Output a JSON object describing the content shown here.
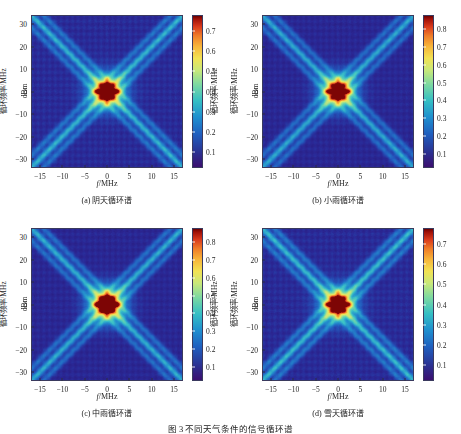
{
  "figure": {
    "caption": "图 3   不同天气条件的信号循环谱",
    "axis": {
      "xlabel": "f/MHz",
      "ylabel": "循环频率/MHz",
      "xticks": [
        -15,
        -10,
        -5,
        0,
        5,
        10,
        15
      ],
      "yticks": [
        30,
        20,
        10,
        0,
        -10,
        -20,
        -30
      ],
      "xlim": [
        -17,
        17
      ],
      "ylim": [
        -34,
        34
      ],
      "colorbar_label": "dBm"
    }
  },
  "chart_data": {
    "type": "heatmap",
    "title": "图 3   不同天气条件的信号循环谱",
    "xlabel": "f/MHz",
    "ylabel": "循环频率/MHz",
    "zlabel": "dBm",
    "xlim": [
      -17,
      17
    ],
    "ylim": [
      -34,
      34
    ],
    "xticks": [
      -15,
      -10,
      -5,
      0,
      5,
      10,
      15
    ],
    "yticks": [
      -30,
      -20,
      -10,
      0,
      10,
      20,
      30
    ],
    "grid": false,
    "legend": "colorbar-right",
    "colormap": "jet",
    "panels": [
      {
        "id": "a",
        "caption": "(a) 阴天循环谱",
        "label": "阴天循环谱",
        "weather": "阴天",
        "cbar_ticks": [
          0.1,
          0.2,
          0.3,
          0.4,
          0.5,
          0.6,
          0.7
        ],
        "zlim": [
          0.02,
          0.78
        ],
        "peak_value": 0.7,
        "center_intensity": 0.62,
        "background_level": 0.1,
        "ridge_level": 0.24,
        "features": [
          "X-shaped diagonal ridges through origin with slope +/-2",
          "bright cross-shaped cluster of cyclic peaks at origin",
          "four satellite lobes at alpha = +/-3 MHz and f = +/-2 MHz"
        ]
      },
      {
        "id": "b",
        "caption": "(b) 小雨循环谱",
        "label": "小雨循环谱",
        "weather": "小雨",
        "cbar_ticks": [
          0.1,
          0.2,
          0.3,
          0.4,
          0.5,
          0.6,
          0.7,
          0.8
        ],
        "zlim": [
          0.02,
          0.88
        ],
        "peak_value": 0.8,
        "center_intensity": 0.7,
        "background_level": 0.1,
        "ridge_level": 0.26,
        "features": [
          "X-shaped diagonal ridges through origin",
          "central peak cluster brighter than panel (a)",
          "discrete red peak points at origin"
        ]
      },
      {
        "id": "c",
        "caption": "(c) 中雨循环谱",
        "label": "中雨循环谱",
        "weather": "中雨",
        "cbar_ticks": [
          0.1,
          0.2,
          0.3,
          0.4,
          0.5,
          0.6,
          0.7,
          0.8
        ],
        "zlim": [
          0.02,
          0.88
        ],
        "peak_value": 0.8,
        "center_intensity": 0.78,
        "background_level": 0.1,
        "ridge_level": 0.27,
        "features": [
          "strongest central cyclic feature of the four panels",
          "five distinct dark-red peak points forming a plus sign",
          "X-shaped diagonal ridges through origin"
        ]
      },
      {
        "id": "d",
        "caption": "(d) 雪天循环谱",
        "label": "雪天循环谱",
        "weather": "雪天",
        "cbar_ticks": [
          0.1,
          0.2,
          0.3,
          0.4,
          0.5,
          0.6,
          0.7
        ],
        "zlim": [
          0.02,
          0.78
        ],
        "peak_value": 0.7,
        "center_intensity": 0.6,
        "background_level": 0.1,
        "ridge_level": 0.25,
        "features": [
          "X-shaped diagonal ridges through origin",
          "moderate central peak cluster similar to panel (a)",
          "broad yellow-green halo around origin"
        ]
      }
    ]
  }
}
